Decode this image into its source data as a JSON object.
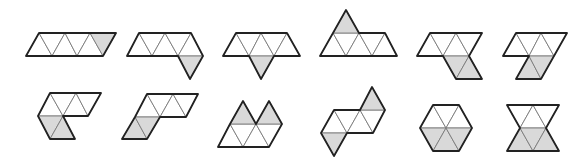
{
  "figure": {
    "rows": 2,
    "columns": 6,
    "colors": {
      "background": "#ffffff",
      "shaded": "#d9d9d9",
      "unshaded": "#ffffff",
      "outline": "#222222",
      "inner_edge": "#7a7a7a"
    },
    "shapes": [
      {
        "id": 1,
        "row": 1,
        "col": 1,
        "triangles": 6,
        "shaded": 1
      },
      {
        "id": 2,
        "row": 1,
        "col": 2,
        "triangles": 6,
        "shaded": 1
      },
      {
        "id": 3,
        "row": 1,
        "col": 3,
        "triangles": 6,
        "shaded": 1
      },
      {
        "id": 4,
        "row": 1,
        "col": 4,
        "triangles": 6,
        "shaded": 1
      },
      {
        "id": 5,
        "row": 1,
        "col": 5,
        "triangles": 6,
        "shaded": 2
      },
      {
        "id": 6,
        "row": 1,
        "col": 6,
        "triangles": 6,
        "shaded": 2
      },
      {
        "id": 7,
        "row": 2,
        "col": 1,
        "triangles": 6,
        "shaded": 2
      },
      {
        "id": 8,
        "row": 2,
        "col": 2,
        "triangles": 6,
        "shaded": 2
      },
      {
        "id": 9,
        "row": 2,
        "col": 3,
        "triangles": 6,
        "shaded": 2
      },
      {
        "id": 10,
        "row": 2,
        "col": 4,
        "triangles": 6,
        "shaded": 2
      },
      {
        "id": 11,
        "row": 2,
        "col": 5,
        "triangles": 6,
        "shaded": 3
      },
      {
        "id": 12,
        "row": 2,
        "col": 6,
        "triangles": 6,
        "shaded": 3
      }
    ]
  }
}
